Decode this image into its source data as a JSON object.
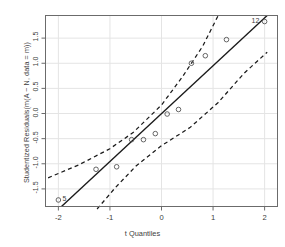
{
  "chart_data": {
    "type": "scatter",
    "title": "",
    "xlabel": "t Quantiles",
    "ylabel": "Studentized Residuals(m(A ~ N, data = m))",
    "xlim": [
      -2.25,
      2.25
    ],
    "ylim": [
      -1.85,
      1.95
    ],
    "grid": true,
    "legend": null,
    "xticks": [
      {
        "value": -2,
        "label": "-2"
      },
      {
        "value": -1,
        "label": "-1"
      },
      {
        "value": 0,
        "label": "0"
      },
      {
        "value": 1,
        "label": "1"
      },
      {
        "value": 2,
        "label": "2"
      }
    ],
    "yticks": [
      {
        "value": 1.5,
        "label": "1.5"
      },
      {
        "value": 1.0,
        "label": "1.0"
      },
      {
        "value": 0.5,
        "label": "0.5"
      },
      {
        "value": 0.0,
        "label": "0.0"
      },
      {
        "value": -0.5,
        "label": "-0.5"
      },
      {
        "value": -1.0,
        "label": "-1.0"
      },
      {
        "value": -1.5,
        "label": "-1.5"
      }
    ],
    "points": [
      {
        "x": -2.0,
        "y": -1.72,
        "label": "5"
      },
      {
        "x": -1.27,
        "y": -1.11,
        "label": ""
      },
      {
        "x": -0.87,
        "y": -1.06,
        "label": ""
      },
      {
        "x": -0.58,
        "y": -0.52,
        "label": ""
      },
      {
        "x": -0.35,
        "y": -0.52,
        "label": ""
      },
      {
        "x": -0.12,
        "y": -0.4,
        "label": ""
      },
      {
        "x": 0.11,
        "y": -0.01,
        "label": ""
      },
      {
        "x": 0.33,
        "y": 0.08,
        "label": ""
      },
      {
        "x": 0.58,
        "y": 1.0,
        "label": ""
      },
      {
        "x": 0.85,
        "y": 1.15,
        "label": ""
      },
      {
        "x": 1.26,
        "y": 1.47,
        "label": ""
      },
      {
        "x": 2.0,
        "y": 1.83,
        "label": "12"
      }
    ],
    "reference_line": {
      "style": "solid",
      "x1": -1.94,
      "y1": -1.85,
      "x2": 2.05,
      "y2": 1.95
    },
    "confidence_band": {
      "style": "dashed",
      "upper": [
        {
          "x": -2.2,
          "y": -1.28
        },
        {
          "x": -1.6,
          "y": -1.02
        },
        {
          "x": -1.0,
          "y": -0.7
        },
        {
          "x": -0.55,
          "y": -0.38
        },
        {
          "x": 0.0,
          "y": 0.17
        },
        {
          "x": 0.4,
          "y": 0.72
        },
        {
          "x": 0.8,
          "y": 1.34
        },
        {
          "x": 1.1,
          "y": 1.95
        }
      ],
      "lower": [
        {
          "x": -1.25,
          "y": -1.9
        },
        {
          "x": -0.9,
          "y": -1.48
        },
        {
          "x": -0.5,
          "y": -1.05
        },
        {
          "x": 0.0,
          "y": -0.64
        },
        {
          "x": 0.55,
          "y": -0.28
        },
        {
          "x": 1.1,
          "y": 0.22
        },
        {
          "x": 1.6,
          "y": 0.8
        },
        {
          "x": 2.05,
          "y": 1.22
        }
      ]
    },
    "colors": {
      "line": "#1a1a1a",
      "band": "#1a1a1a",
      "point": "#555555",
      "grid": "#e4e4e4",
      "axis": "#6b6b6b",
      "text": "#3d3d3d",
      "background": "#ffffff"
    }
  }
}
